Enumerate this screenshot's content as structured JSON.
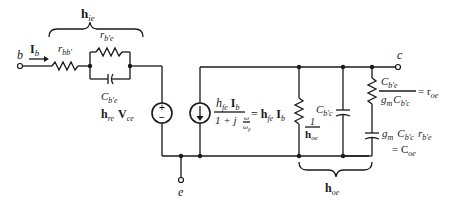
{
  "diagram": {
    "type": "hybrid-pi equivalent circuit",
    "terminals": {
      "base": "b",
      "collector": "c",
      "emitter": "e"
    },
    "input_current": {
      "symbol": "I",
      "sub": "b"
    },
    "brace_top": {
      "symbol": "h",
      "sub": "ie"
    },
    "brace_bottom": {
      "symbol": "h",
      "sub": "oe"
    },
    "components": {
      "r_bb": {
        "symbol": "r",
        "sub": "bb'"
      },
      "r_be": {
        "symbol": "r",
        "sub": "b'e"
      },
      "c_be": {
        "symbol": "C",
        "sub": "b'e"
      },
      "voltage_source": {
        "h": "h",
        "h_sub": "re",
        "v": "V",
        "v_sub": "ce",
        "sign_top": "+",
        "sign_bottom": "−"
      },
      "current_source": {
        "num_h": "h",
        "num_h_sub": "fe",
        "num_i": "I",
        "num_i_sub": "b",
        "den_1": "1 + j",
        "den_w": "ω",
        "den_wb": "ω",
        "den_wb_sub": "β",
        "equals": "=",
        "rhs_h": "h",
        "rhs_h_sub": "fe",
        "rhs_i": "I",
        "rhs_i_sub": "b"
      },
      "r_out": {
        "num": "1",
        "den": "h",
        "den_sub": "oe"
      },
      "c_bc": {
        "symbol": "C",
        "sub": "b'c"
      },
      "r_oe": {
        "num_c": "C",
        "num_c_sub": "b'e",
        "den_g": "g",
        "den_g_sub": "m",
        "den_c": "C",
        "den_c_sub": "b'c",
        "equals": "= r",
        "r_sub": "oe"
      },
      "c_oe": {
        "g": "g",
        "g_sub": "m",
        "c": "C",
        "c_sub": "b'c",
        "r": "r",
        "r_sub": "b'e",
        "equals": "= C",
        "res_sub": "oe"
      }
    }
  }
}
